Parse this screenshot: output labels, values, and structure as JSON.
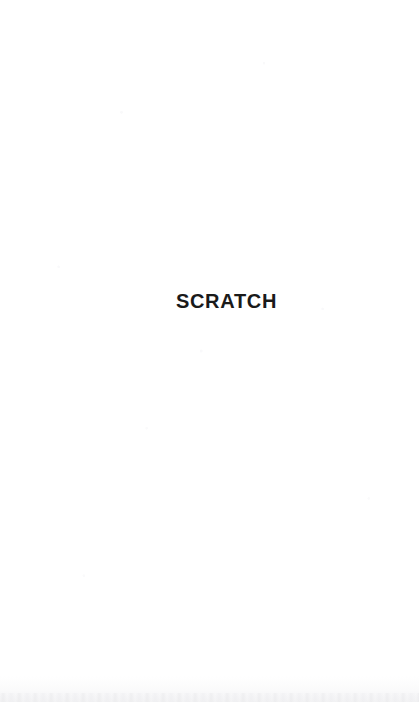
{
  "page": {
    "kind": "scanned-book-page",
    "width": 419,
    "height": 702,
    "background_color": "#ffffff"
  },
  "content": {
    "heading": "SCRATCH",
    "heading_color": "#1a1a1a"
  }
}
